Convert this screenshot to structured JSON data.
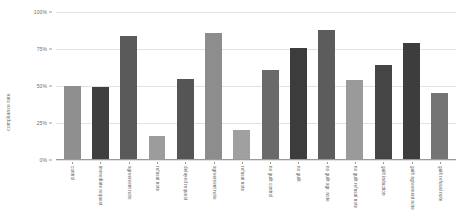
{
  "chart_data": {
    "type": "bar",
    "title": "",
    "subtitle": "",
    "xlabel": "",
    "ylabel": "compliance rate",
    "ylim": [
      0,
      100
    ],
    "grid": true,
    "legend": "none",
    "y_ticks": [
      {
        "value": 0,
        "label": "0%"
      },
      {
        "value": 25,
        "label": "25%"
      },
      {
        "value": 50,
        "label": "50%"
      },
      {
        "value": 75,
        "label": "75%"
      },
      {
        "value": 100,
        "label": "100%"
      }
    ],
    "categories": [
      "control",
      "immediate request",
      "agreement note",
      "refusal note",
      "delayed request",
      "agreement note",
      "refusal note",
      "no guilt control",
      "no guilt",
      "no guilt agr. note",
      "no guilt refusal note",
      "guilt induction",
      "guilt agreement note",
      "guilt refusal note"
    ],
    "values": [
      50,
      49,
      84,
      16,
      55,
      86,
      20,
      61,
      76,
      88,
      54,
      64,
      79,
      45
    ],
    "bar_colors": [
      "#8f8f8f",
      "#3f3f3f",
      "#5a5a5a",
      "#9c9c9c",
      "#555555",
      "#8d8d8d",
      "#a0a0a0",
      "#6a6a6a",
      "#3c3c3c",
      "#5c5c5c",
      "#9a9a9a",
      "#454545",
      "#3d3d3d",
      "#747474"
    ]
  },
  "style": {
    "background": "#ffffff",
    "gridline_color": "#e2e2e2",
    "axis_color": "#9a9a9a",
    "tick_text_color": "#6d6d6d",
    "label_text_color": "#5e5e5e"
  }
}
